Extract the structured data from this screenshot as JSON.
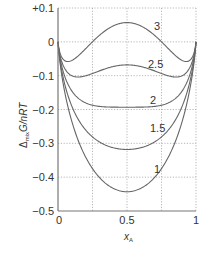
{
  "chart_data": {
    "type": "line",
    "title": "",
    "xlabel": "x_A",
    "ylabel": "Δ_mix G/nRT",
    "xlim": [
      0,
      1
    ],
    "ylim": [
      -0.5,
      0.1
    ],
    "x_ticks": [
      "0",
      "0.5",
      "1"
    ],
    "y_ticks": [
      "+0.1",
      "0",
      "−0.1",
      "−0.2",
      "−0.3",
      "−0.4",
      "−0.5"
    ],
    "grid": true,
    "legend": "inline curve labels",
    "model": "x ln x + (1−x) ln(1−x) + ξ x(1−x)",
    "x": [
      0.0,
      0.05,
      0.1,
      0.2,
      0.3,
      0.4,
      0.5,
      0.6,
      0.7,
      0.8,
      0.9,
      0.95,
      1.0
    ],
    "series": [
      {
        "name": "1",
        "values": [
          0,
          -0.151,
          -0.235,
          -0.34,
          -0.401,
          -0.433,
          -0.443,
          -0.433,
          -0.401,
          -0.34,
          -0.235,
          -0.151,
          0
        ]
      },
      {
        "name": "1.5",
        "values": [
          0,
          -0.127,
          -0.19,
          -0.26,
          -0.296,
          -0.313,
          -0.318,
          -0.313,
          -0.296,
          -0.26,
          -0.19,
          -0.127,
          0
        ]
      },
      {
        "name": "2",
        "values": [
          0,
          -0.104,
          -0.145,
          -0.18,
          -0.191,
          -0.193,
          -0.193,
          -0.193,
          -0.191,
          -0.18,
          -0.145,
          -0.104,
          0
        ]
      },
      {
        "name": "2.5",
        "values": [
          0,
          -0.08,
          -0.1,
          -0.1,
          -0.086,
          -0.073,
          -0.068,
          -0.073,
          -0.086,
          -0.1,
          -0.1,
          -0.08,
          0
        ]
      },
      {
        "name": "3",
        "values": [
          0,
          -0.056,
          -0.055,
          -0.02,
          0.019,
          0.047,
          0.057,
          0.047,
          0.019,
          -0.02,
          -0.055,
          -0.056,
          0
        ]
      }
    ]
  },
  "labels": {
    "x_axis": "x",
    "x_axis_sub": "A",
    "y_axis_delta": "Δ",
    "y_axis_sub": "mix",
    "y_axis_main": "G/nRT",
    "curve_labels": [
      "3",
      "2.5",
      "2",
      "1.5",
      "1"
    ]
  }
}
